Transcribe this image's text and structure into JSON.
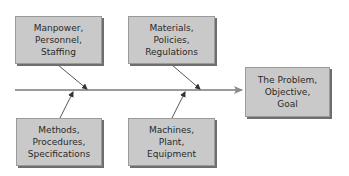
{
  "diagram": {
    "type": "fishbone (Ishikawa) cause-and-effect diagram",
    "colors": {
      "box_fill": "#c9c9c9",
      "box_shadow": "#6e6e6e",
      "line": "#6f6f6f",
      "text": "#2a2a2a"
    },
    "effect": {
      "lines": [
        "The Problem,",
        "Objective,",
        "Goal"
      ]
    },
    "causes": [
      {
        "position": "top-left",
        "lines": [
          "Manpower,",
          "Personnel,",
          "Staffing"
        ]
      },
      {
        "position": "top-right",
        "lines": [
          "Materials,",
          "Policies,",
          "Regulations"
        ]
      },
      {
        "position": "bottom-left",
        "lines": [
          "Methods,",
          "Procedures,",
          "Specifications"
        ]
      },
      {
        "position": "bottom-right",
        "lines": [
          "Machines,",
          "Plant,",
          "Equipment"
        ]
      }
    ]
  }
}
